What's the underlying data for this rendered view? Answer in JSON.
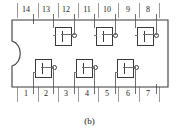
{
  "figure": {
    "caption": "(b)",
    "kind": "dip-14-ic-pinout-diagram",
    "package_pin_count": 14,
    "gate_symbol_label": "1",
    "notch_side": "left"
  },
  "colors": {
    "outline": "#3a3a3a",
    "lead": "#6f6f6f",
    "tick": "#9a9a9a",
    "text": "#1a1a1a",
    "background": "#ffffff"
  },
  "pins": {
    "top_row": [
      {
        "number": "14",
        "x": 26
      },
      {
        "number": "13",
        "x": 46
      },
      {
        "number": "12",
        "x": 66
      },
      {
        "number": "11",
        "x": 87
      },
      {
        "number": "10",
        "x": 107
      },
      {
        "number": "9",
        "x": 128
      },
      {
        "number": "8",
        "x": 148
      }
    ],
    "bottom_row": [
      {
        "number": "1",
        "x": 26
      },
      {
        "number": "2",
        "x": 46
      },
      {
        "number": "3",
        "x": 66
      },
      {
        "number": "4",
        "x": 87
      },
      {
        "number": "5",
        "x": 107
      },
      {
        "number": "6",
        "x": 128
      },
      {
        "number": "7",
        "x": 148
      }
    ]
  },
  "ticks": {
    "top_x": [
      17,
      38,
      58,
      78,
      98,
      118,
      139,
      159
    ],
    "bottom_x": [
      17,
      38,
      58,
      78,
      98,
      118,
      139,
      159
    ]
  },
  "leads": {
    "top_x": [
      33,
      53,
      74,
      94,
      115,
      135,
      156
    ],
    "bottom_x": [
      33,
      53,
      74,
      94,
      115,
      135,
      156
    ]
  },
  "gates": {
    "top": [
      {
        "id": "gate-top-1",
        "x": 55,
        "y": 27
      },
      {
        "id": "gate-top-2",
        "x": 96,
        "y": 27
      },
      {
        "id": "gate-top-3",
        "x": 137,
        "y": 27
      }
    ],
    "bottom": [
      {
        "id": "gate-bottom-1",
        "x": 35,
        "y": 59
      },
      {
        "id": "gate-bottom-2",
        "x": 76,
        "y": 59
      },
      {
        "id": "gate-bottom-3",
        "x": 117,
        "y": 59
      }
    ]
  }
}
